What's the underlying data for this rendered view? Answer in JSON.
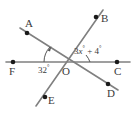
{
  "figure": {
    "background_color": "#ffffff",
    "line_color": "#808080",
    "label_color": "#3a3a3a",
    "dot_color": "#1a1a1a",
    "points": [
      {
        "name": "A",
        "label": "A",
        "x": 27,
        "y": 33
      },
      {
        "name": "B",
        "label": "B",
        "x": 96,
        "y": 17
      },
      {
        "name": "C",
        "label": "C",
        "x": 117,
        "y": 62
      },
      {
        "name": "D",
        "label": "D",
        "x": 108,
        "y": 84
      },
      {
        "name": "E",
        "label": "E",
        "x": 45,
        "y": 97
      },
      {
        "name": "F",
        "label": "F",
        "x": 13,
        "y": 62
      },
      {
        "name": "O",
        "label": "O",
        "x": 66,
        "y": 63
      }
    ],
    "lines": [
      {
        "name": "line-FC",
        "from": "F",
        "to": "C"
      },
      {
        "name": "line-AD",
        "from": "A",
        "to": "D"
      },
      {
        "name": "line-BE",
        "from": "B",
        "to": "E"
      }
    ],
    "angles": [
      {
        "name": "angle-FOA",
        "vertex": "O",
        "rays": [
          "F",
          "A"
        ],
        "label": "32°",
        "value": 32,
        "unit": "degrees",
        "has_arrow_arc": true
      },
      {
        "name": "angle-BOC",
        "vertex": "O",
        "rays": [
          "B",
          "C"
        ],
        "label_expression": "3x° + 4°",
        "coefficient": 3,
        "variable": "x",
        "constant": 4,
        "unit": "degrees",
        "has_arrow_arc": false
      }
    ]
  },
  "labels": {
    "A": "A",
    "B": "B",
    "C": "C",
    "D": "D",
    "E": "E",
    "F": "F",
    "O": "O",
    "angle_left": "32",
    "angle_right_coeff": "3",
    "angle_right_var": "x",
    "angle_right_plus": "+ 4",
    "degree": "°"
  }
}
